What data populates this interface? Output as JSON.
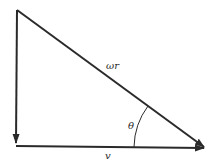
{
  "diagram": {
    "type": "velocity-triangle",
    "colors": {
      "background": "#ffffff",
      "stroke": "#2a2a2a"
    },
    "vertices": {
      "top": [
        17,
        10
      ],
      "bottom_left": [
        16,
        146
      ],
      "right": [
        205,
        148
      ]
    },
    "labels": {
      "hypotenuse": "ωr",
      "angle": "θ",
      "base": "v"
    }
  }
}
